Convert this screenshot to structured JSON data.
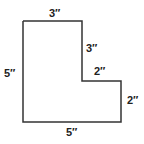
{
  "diagram": {
    "shape": "L-shaped polygon",
    "stroke_color": "#333333",
    "labels": {
      "top": "3″",
      "left": "5″",
      "right_upper": "3″",
      "inner_horizontal": "2″",
      "right_lower": "2″",
      "bottom": "5″"
    }
  }
}
